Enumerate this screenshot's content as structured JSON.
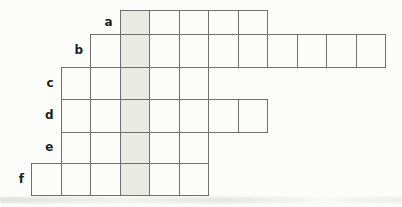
{
  "puzzle": {
    "type": "word-ladder-grid",
    "shaded_column": 4,
    "rows": [
      {
        "label": "a",
        "start_col": 4,
        "num_cells": 5,
        "shaded_cell_index": 0
      },
      {
        "label": "b",
        "start_col": 3,
        "num_cells": 10,
        "shaded_cell_index": 1
      },
      {
        "label": "c",
        "start_col": 2,
        "num_cells": 5,
        "shaded_cell_index": 2
      },
      {
        "label": "d",
        "start_col": 2,
        "num_cells": 7,
        "shaded_cell_index": 2
      },
      {
        "label": "e",
        "start_col": 2,
        "num_cells": 5,
        "shaded_cell_index": 2
      },
      {
        "label": "f",
        "start_col": 1,
        "num_cells": 6,
        "shaded_cell_index": 3
      }
    ],
    "cell_values": [],
    "colors": {
      "background": "#fcfcfa",
      "grid_line": "#6f6f6f",
      "shade": "#eaeae5",
      "label_text": "#1f1f1f"
    }
  }
}
